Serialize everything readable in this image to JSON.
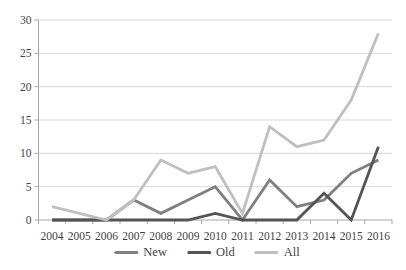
{
  "chart_data": {
    "type": "line",
    "title": "",
    "xlabel": "",
    "ylabel": "",
    "categories": [
      "2004",
      "2005",
      "2006",
      "2007",
      "2008",
      "2009",
      "2010",
      "2011",
      "2012",
      "2013",
      "2014",
      "2015",
      "2016"
    ],
    "series": [
      {
        "name": "New",
        "color": "#7f7f7f",
        "values": [
          0,
          0,
          0,
          3,
          1,
          3,
          5,
          0,
          6,
          2,
          3,
          7,
          9
        ]
      },
      {
        "name": "Old",
        "color": "#545454",
        "values": [
          0,
          0,
          0,
          0,
          0,
          0,
          1,
          0,
          0,
          0,
          4,
          0,
          11
        ]
      },
      {
        "name": "All",
        "color": "#bfbfbf",
        "values": [
          2,
          1,
          0,
          3,
          9,
          7,
          8,
          1,
          14,
          11,
          12,
          18,
          28
        ]
      }
    ],
    "ylim": [
      0,
      30
    ],
    "yticks": [
      0,
      5,
      10,
      15,
      20,
      25,
      30
    ],
    "grid": true,
    "legend_position": "bottom",
    "legend_order": [
      "New",
      "Old",
      "All"
    ]
  },
  "colors": {
    "background": "#ffffff",
    "gridline": "#d9d9d9",
    "axis": "#a6a6a6",
    "tick_text": "#3f3f3f"
  }
}
